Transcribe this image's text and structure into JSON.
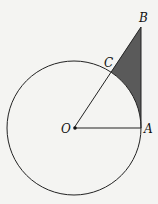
{
  "diagram": {
    "type": "geometry",
    "circle": {
      "center_label": "O",
      "cx": 74,
      "cy": 128,
      "r": 67
    },
    "points": {
      "O": {
        "label": "O",
        "x": 74,
        "y": 128
      },
      "A": {
        "label": "A",
        "x": 141,
        "y": 128
      },
      "B": {
        "label": "B",
        "x": 141,
        "y": 27
      },
      "C": {
        "label": "C",
        "x": 111,
        "y": 72
      }
    },
    "segments": [
      "OA",
      "OB",
      "AB"
    ],
    "shaded_region": "region bounded by segment CB, segment BA, and arc AC",
    "colors": {
      "line": "#222222",
      "shade": "#5a5a5a",
      "background": "#f4f4f2"
    }
  }
}
